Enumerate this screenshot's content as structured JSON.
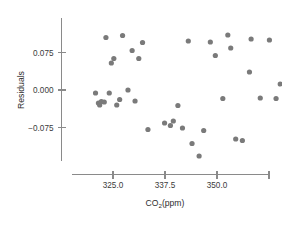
{
  "chart_data": {
    "type": "scatter",
    "title": "",
    "xlabel": "CO₂(ppm)",
    "ylabel": "Residuals",
    "xlabel_main": "CO",
    "xlabel_subscript": "2",
    "xlabel_tail": "(ppm)",
    "xticks": [
      325.0,
      337.5,
      350.0,
      362.5
    ],
    "xtick_labels": [
      "325.0",
      "337.5",
      "350.0",
      ""
    ],
    "yticks": [
      0.075,
      0.0,
      -0.075
    ],
    "ytick_labels": [
      "0.075",
      "0.000",
      "−0.075"
    ],
    "xlim": [
      319.0,
      366.5
    ],
    "ylim": [
      -0.135,
      0.125
    ],
    "grid": false,
    "legend": false,
    "point_color": "#7a7a7a",
    "axis_color": "#8a8a8a",
    "point_radius": 2.6,
    "x": [
      320.8,
      321.5,
      321.8,
      322.2,
      322.9,
      323.3,
      324.1,
      324.6,
      325.2,
      325.9,
      326.6,
      327.3,
      328.6,
      329.6,
      330.3,
      331.2,
      332.1,
      333.4,
      337.4,
      338.8,
      339.5,
      340.6,
      341.7,
      343.1,
      344.0,
      345.7,
      346.8,
      348.4,
      349.6,
      351.4,
      352.6,
      353.3,
      354.5,
      356.1,
      357.8,
      358.2,
      360.4,
      362.6,
      364.2,
      365.2
    ],
    "y": [
      -0.006,
      -0.026,
      -0.03,
      -0.023,
      -0.024,
      0.105,
      -0.006,
      0.054,
      0.063,
      -0.03,
      -0.019,
      0.109,
      0.0,
      0.079,
      -0.022,
      0.063,
      0.095,
      -0.079,
      -0.066,
      -0.071,
      -0.062,
      -0.031,
      -0.076,
      0.098,
      -0.107,
      -0.132,
      -0.081,
      0.096,
      0.069,
      -0.017,
      0.11,
      0.084,
      -0.098,
      -0.101,
      0.036,
      0.102,
      -0.016,
      0.1,
      -0.017,
      0.012
    ],
    "points": [
      {
        "x": 320.8,
        "y": -0.006
      },
      {
        "x": 321.5,
        "y": -0.026
      },
      {
        "x": 321.8,
        "y": -0.03
      },
      {
        "x": 322.2,
        "y": -0.023
      },
      {
        "x": 322.9,
        "y": -0.024
      },
      {
        "x": 323.3,
        "y": 0.105
      },
      {
        "x": 324.1,
        "y": -0.006
      },
      {
        "x": 324.6,
        "y": 0.054
      },
      {
        "x": 325.2,
        "y": 0.063
      },
      {
        "x": 325.9,
        "y": -0.03
      },
      {
        "x": 326.6,
        "y": -0.019
      },
      {
        "x": 327.3,
        "y": 0.109
      },
      {
        "x": 328.6,
        "y": 0.0
      },
      {
        "x": 329.6,
        "y": 0.079
      },
      {
        "x": 330.3,
        "y": -0.022
      },
      {
        "x": 331.2,
        "y": 0.063
      },
      {
        "x": 332.1,
        "y": 0.095
      },
      {
        "x": 333.4,
        "y": -0.079
      },
      {
        "x": 337.4,
        "y": -0.066
      },
      {
        "x": 338.8,
        "y": -0.071
      },
      {
        "x": 339.5,
        "y": -0.062
      },
      {
        "x": 340.6,
        "y": -0.031
      },
      {
        "x": 341.7,
        "y": -0.076
      },
      {
        "x": 343.1,
        "y": 0.098
      },
      {
        "x": 344.0,
        "y": -0.107
      },
      {
        "x": 345.7,
        "y": -0.132
      },
      {
        "x": 346.8,
        "y": -0.081
      },
      {
        "x": 348.4,
        "y": 0.096
      },
      {
        "x": 349.6,
        "y": 0.069
      },
      {
        "x": 351.4,
        "y": -0.017
      },
      {
        "x": 352.6,
        "y": 0.11
      },
      {
        "x": 353.3,
        "y": 0.084
      },
      {
        "x": 354.5,
        "y": -0.098
      },
      {
        "x": 356.1,
        "y": -0.101
      },
      {
        "x": 357.8,
        "y": 0.036
      },
      {
        "x": 358.2,
        "y": 0.102
      },
      {
        "x": 360.4,
        "y": -0.016
      },
      {
        "x": 362.6,
        "y": 0.1
      },
      {
        "x": 364.2,
        "y": -0.017
      },
      {
        "x": 365.2,
        "y": 0.012
      }
    ]
  }
}
